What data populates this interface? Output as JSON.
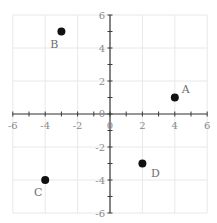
{
  "chart_data": {
    "type": "scatter",
    "title": "",
    "xlabel": "",
    "ylabel": "",
    "xlim": [
      -6,
      6
    ],
    "ylim": [
      -6,
      6
    ],
    "grid": true,
    "grid_step": 2,
    "x_ticks": [
      -6,
      -4,
      -2,
      0,
      2,
      4,
      6
    ],
    "y_ticks": [
      -6,
      -4,
      -2,
      0,
      2,
      4,
      6
    ],
    "x_tick_labels": [
      "-6",
      "-4",
      "-2",
      "0",
      "2",
      "4",
      "6"
    ],
    "y_tick_labels": [
      "-6",
      "-4",
      "-2",
      "0",
      "2",
      "4",
      "6"
    ],
    "minor_tick_step": 1,
    "points": [
      {
        "label": "A",
        "x": 4,
        "y": 1
      },
      {
        "label": "B",
        "x": -3,
        "y": 5
      },
      {
        "label": "C",
        "x": -4,
        "y": -4
      },
      {
        "label": "D",
        "x": 2,
        "y": -3
      }
    ],
    "legend": null
  },
  "colors": {
    "axis": "#3a3a3a",
    "grid": "#e8e8e8",
    "point": "#111111",
    "tick_label": "#8a8a8a",
    "point_label": "#6e6e6e"
  }
}
